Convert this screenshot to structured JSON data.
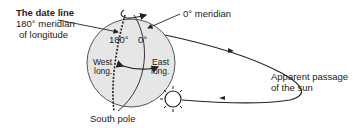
{
  "labels": {
    "date_line_title": "The date line",
    "date_line_sub1": "180° meridian",
    "date_line_sub2": "of longitude",
    "zero_meridian": "0° meridian",
    "deg180": "180°",
    "deg0": "0°",
    "west1": "West",
    "west2": "long.",
    "east1": "East",
    "east2": "long.",
    "south_pole": "South pole",
    "sun_path1": "Apparent passage",
    "sun_path2": "of the sun"
  },
  "colors": {
    "globe_fill": "#e6e6e6",
    "line": "#222222"
  }
}
